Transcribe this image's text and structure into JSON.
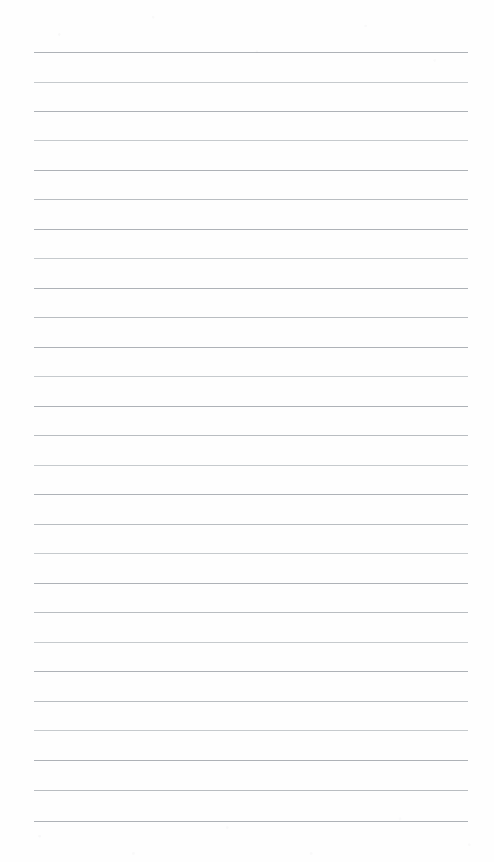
{
  "document": {
    "kind": "ruled-notepad-page",
    "title": "Blank lined notepad page",
    "content_text": "",
    "page_width": 494,
    "page_height": 862,
    "background_color": "#fefefe"
  },
  "ruling": {
    "line_count": 27,
    "line_color": "#b9bdc1",
    "line_thickness": 1,
    "first_line_y": 52,
    "line_spacing": 29.5,
    "left_margin": 34,
    "right_margin": 26,
    "line_width": 434,
    "margin_rule_visible": false,
    "header_visible": false,
    "lines": [
      {
        "index": 1,
        "y": 52,
        "shade": "dark"
      },
      {
        "index": 2,
        "y": 82,
        "shade": "faint"
      },
      {
        "index": 3,
        "y": 111,
        "shade": "dark"
      },
      {
        "index": 4,
        "y": 140,
        "shade": "faint"
      },
      {
        "index": 5,
        "y": 170,
        "shade": "dark"
      },
      {
        "index": 6,
        "y": 199,
        "shade": "normal"
      },
      {
        "index": 7,
        "y": 229,
        "shade": "dark"
      },
      {
        "index": 8,
        "y": 258,
        "shade": "faint"
      },
      {
        "index": 9,
        "y": 288,
        "shade": "dark"
      },
      {
        "index": 10,
        "y": 317,
        "shade": "normal"
      },
      {
        "index": 11,
        "y": 347,
        "shade": "dark"
      },
      {
        "index": 12,
        "y": 376,
        "shade": "faint"
      },
      {
        "index": 13,
        "y": 406,
        "shade": "dark"
      },
      {
        "index": 14,
        "y": 435,
        "shade": "normal"
      },
      {
        "index": 15,
        "y": 465,
        "shade": "faint"
      },
      {
        "index": 16,
        "y": 494,
        "shade": "dark"
      },
      {
        "index": 17,
        "y": 524,
        "shade": "normal"
      },
      {
        "index": 18,
        "y": 553,
        "shade": "faint"
      },
      {
        "index": 19,
        "y": 583,
        "shade": "dark"
      },
      {
        "index": 20,
        "y": 612,
        "shade": "normal"
      },
      {
        "index": 21,
        "y": 642,
        "shade": "faint"
      },
      {
        "index": 22,
        "y": 671,
        "shade": "dark"
      },
      {
        "index": 23,
        "y": 701,
        "shade": "normal"
      },
      {
        "index": 24,
        "y": 730,
        "shade": "faint"
      },
      {
        "index": 25,
        "y": 760,
        "shade": "dark"
      },
      {
        "index": 26,
        "y": 790,
        "shade": "normal"
      },
      {
        "index": 27,
        "y": 821,
        "shade": "dark"
      }
    ]
  }
}
